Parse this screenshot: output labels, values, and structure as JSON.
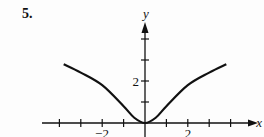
{
  "problem_number": "5.",
  "chart_data": {
    "type": "line",
    "title": "",
    "xlabel": "x",
    "ylabel": "y",
    "x_ticks": [
      -4,
      -3,
      -2,
      -1,
      0,
      1,
      2,
      3,
      4
    ],
    "x_tick_labels": {
      "-2": "−2",
      "2": "2"
    },
    "y_ticks": [
      1,
      2,
      3,
      4
    ],
    "y_tick_labels": {
      "2": "2"
    },
    "xlim": [
      -4.5,
      5
    ],
    "ylim": [
      0,
      5
    ],
    "grid": false,
    "series": [
      {
        "name": "curve",
        "x": [
          -3.8,
          -3,
          -2,
          -1,
          -0.5,
          0,
          0.5,
          1,
          2,
          3,
          3.8
        ],
        "y": [
          2.8,
          2.4,
          1.8,
          0.8,
          0.25,
          0,
          0.25,
          0.8,
          1.8,
          2.4,
          2.8
        ]
      }
    ]
  },
  "labels": {
    "x_axis": "x",
    "y_axis": "y",
    "tick_neg2": "−2",
    "tick_pos2": "2",
    "tick_y2": "2"
  }
}
